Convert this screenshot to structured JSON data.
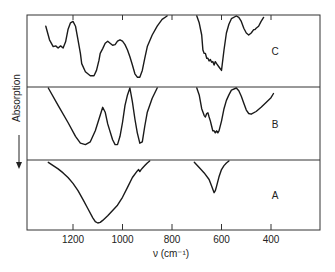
{
  "chart_data": {
    "type": "line",
    "title": "",
    "xlabel": "ν (cm⁻¹)",
    "ylabel": "Absorption",
    "ylabel_arrow": "down",
    "xlim": [
      1390,
      150
    ],
    "x_reversed": true,
    "x_ticks": [
      1200,
      1000,
      800,
      600,
      400
    ],
    "x_tick_labels": [
      "1200",
      "1000",
      "800",
      "600",
      "400"
    ],
    "grid": false,
    "legend": "none",
    "panels": [
      {
        "label": "C",
        "position": "top",
        "segments": [
          {
            "x": [
              1310,
              1295,
              1280,
              1270,
              1260,
              1250,
              1240,
              1230,
              1220,
              1210,
              1200,
              1190,
              1180,
              1170,
              1165,
              1150,
              1130,
              1115,
              1105,
              1095,
              1090,
              1080,
              1070,
              1060,
              1050,
              1040,
              1030,
              1020,
              1010,
              1000,
              990,
              980,
              970,
              960,
              950,
              940,
              930,
              920,
              910,
              900,
              880,
              860,
              840,
              820
            ],
            "y": [
              0.85,
              0.65,
              0.55,
              0.56,
              0.53,
              0.56,
              0.53,
              0.62,
              0.8,
              0.9,
              0.92,
              0.85,
              0.65,
              0.45,
              0.3,
              0.18,
              0.12,
              0.12,
              0.2,
              0.35,
              0.45,
              0.52,
              0.6,
              0.63,
              0.6,
              0.57,
              0.58,
              0.63,
              0.65,
              0.63,
              0.58,
              0.5,
              0.4,
              0.28,
              0.15,
              0.1,
              0.1,
              0.2,
              0.38,
              0.55,
              0.72,
              0.85,
              0.95,
              1.0
            ]
          },
          {
            "x": [
              700,
              690,
              680,
              675,
              670,
              665,
              660,
              655,
              650,
              645,
              640,
              635,
              630,
              625,
              620,
              610,
              600,
              590,
              580,
              570,
              560,
              540,
              530,
              520,
              510,
              500,
              490,
              480,
              470,
              465,
              460,
              450,
              440,
              430
            ],
            "y": [
              1.0,
              0.9,
              0.72,
              0.5,
              0.45,
              0.45,
              0.38,
              0.38,
              0.34,
              0.36,
              0.32,
              0.33,
              0.28,
              0.33,
              0.3,
              0.25,
              0.2,
              0.5,
              0.75,
              0.88,
              0.96,
              1.0,
              0.98,
              0.92,
              0.82,
              0.75,
              0.72,
              0.75,
              0.8,
              0.8,
              0.82,
              0.85,
              0.92,
              0.98
            ]
          }
        ]
      },
      {
        "label": "B",
        "position": "middle",
        "segments": [
          {
            "x": [
              1300,
              1260,
              1220,
              1190,
              1170,
              1150,
              1130,
              1110,
              1095,
              1080,
              1070,
              1060,
              1040,
              1030,
              1020,
              1010,
              1000,
              990,
              980,
              970,
              960,
              950,
              940,
              930,
              920,
              910,
              900,
              880,
              860
            ],
            "y": [
              1.0,
              0.75,
              0.5,
              0.3,
              0.2,
              0.18,
              0.22,
              0.38,
              0.55,
              0.72,
              0.65,
              0.48,
              0.25,
              0.18,
              0.18,
              0.3,
              0.5,
              0.75,
              0.9,
              1.0,
              0.8,
              0.55,
              0.35,
              0.2,
              0.22,
              0.45,
              0.65,
              0.85,
              1.0
            ]
          },
          {
            "x": [
              700,
              690,
              680,
              670,
              665,
              660,
              655,
              650,
              645,
              640,
              635,
              630,
              625,
              620,
              615,
              610,
              600,
              590,
              580,
              570,
              560,
              540,
              530,
              520,
              510,
              500,
              490,
              480,
              460,
              440,
              420,
              400,
              390
            ],
            "y": [
              1.0,
              0.9,
              0.7,
              0.6,
              0.58,
              0.63,
              0.64,
              0.58,
              0.52,
              0.45,
              0.38,
              0.38,
              0.35,
              0.38,
              0.35,
              0.38,
              0.52,
              0.7,
              0.82,
              0.9,
              0.97,
              1.0,
              0.96,
              0.88,
              0.78,
              0.68,
              0.63,
              0.62,
              0.66,
              0.72,
              0.79,
              0.86,
              0.92
            ]
          }
        ]
      },
      {
        "label": "A",
        "position": "bottom",
        "segments": [
          {
            "x": [
              1300,
              1280,
              1260,
              1240,
              1220,
              1200,
              1180,
              1160,
              1140,
              1120,
              1110,
              1100,
              1090,
              1080,
              1060,
              1040,
              1020,
              1000,
              980,
              960,
              940,
              935,
              930,
              925,
              920,
              910,
              900,
              890
            ],
            "y": [
              0.98,
              0.93,
              0.88,
              0.82,
              0.75,
              0.66,
              0.55,
              0.42,
              0.28,
              0.14,
              0.08,
              0.06,
              0.07,
              0.1,
              0.17,
              0.25,
              0.33,
              0.45,
              0.6,
              0.75,
              0.85,
              0.87,
              0.84,
              0.87,
              0.89,
              0.93,
              0.97,
              1.0
            ]
          },
          {
            "x": [
              710,
              690,
              670,
              650,
              640,
              630,
              625,
              620,
              610,
              600,
              590,
              580,
              570
            ],
            "y": [
              0.98,
              0.9,
              0.82,
              0.72,
              0.62,
              0.52,
              0.55,
              0.62,
              0.76,
              0.87,
              0.93,
              0.97,
              1.0
            ]
          }
        ]
      }
    ],
    "y_units": "relative transmittance (absorption increases downward)"
  }
}
